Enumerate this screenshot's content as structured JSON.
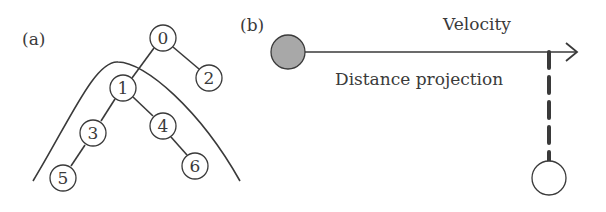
{
  "panel_a": {
    "label": "(a)",
    "nodes": [
      {
        "id": "0",
        "x": 163,
        "y": 38
      },
      {
        "id": "1",
        "x": 123,
        "y": 88
      },
      {
        "id": "2",
        "x": 209,
        "y": 78
      },
      {
        "id": "3",
        "x": 93,
        "y": 133
      },
      {
        "id": "4",
        "x": 163,
        "y": 126
      },
      {
        "id": "5",
        "x": 63,
        "y": 178
      },
      {
        "id": "6",
        "x": 195,
        "y": 166
      }
    ],
    "edges": [
      [
        "0",
        "1"
      ],
      [
        "0",
        "2"
      ],
      [
        "1",
        "3"
      ],
      [
        "1",
        "4"
      ],
      [
        "3",
        "5"
      ],
      [
        "4",
        "6"
      ]
    ]
  },
  "panel_b": {
    "label": "(b)",
    "velocity_label": "Velocity",
    "projection_label": "Distance projection",
    "colors": {
      "source_fill": "#a8a8a8",
      "target_fill": "#ffffff",
      "stroke": "#3a3a3a"
    }
  }
}
